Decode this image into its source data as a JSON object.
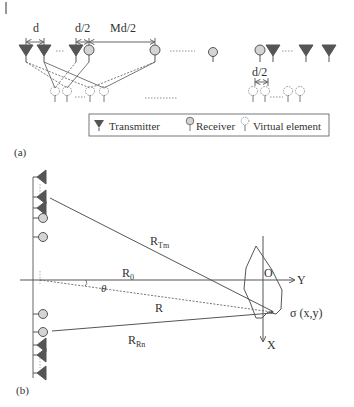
{
  "panel_a": {
    "caption": "(a)",
    "dims": {
      "d": "d",
      "d_half": "d/2",
      "md_half": "Md/2",
      "d_half_right": "d/2"
    },
    "legend": {
      "transmitter": "Transmitter",
      "receiver": "Receiver",
      "virtual": "Virtual element"
    }
  },
  "panel_b": {
    "caption": "(b)",
    "labels": {
      "r_tm_main": "R",
      "r_tm_sub": "Tm",
      "r0_main": "R",
      "r0_sub": "0",
      "r": "R",
      "r_rn_main": "R",
      "r_rn_sub": "Rn",
      "theta": "θ",
      "origin": "O",
      "y_axis": "Y",
      "x_axis": "X",
      "sigma": "σ (x,y)"
    }
  },
  "colors": {
    "line": "#555555",
    "transmitter": "#555555",
    "receiver_fill": "#d4d4d4",
    "text": "#333333"
  }
}
